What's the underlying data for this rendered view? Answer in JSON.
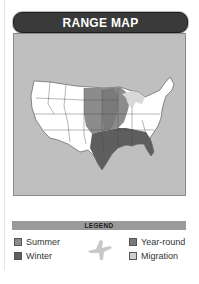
{
  "title": "RANGE MAP",
  "legend": {
    "heading": "LEGEND",
    "items": [
      {
        "label": "Summer",
        "color": "#8c8c8c"
      },
      {
        "label": "Winter",
        "color": "#5e5e5e"
      },
      {
        "label": "Year-round",
        "color": "#7a7a7a"
      },
      {
        "label": "Migration",
        "color": "#cfcfcf"
      }
    ],
    "icon": "bird-silhouette-icon"
  },
  "map": {
    "region": "United States (contiguous)",
    "background_color": "#bfbfbf",
    "land_color": "#ffffff",
    "summer_color": "#8c8c8c",
    "winter_color": "#5e5e5e",
    "yearround_color": "#7a7a7a"
  }
}
